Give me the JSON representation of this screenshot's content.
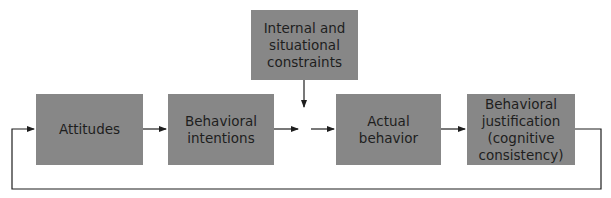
{
  "diagram": {
    "type": "flowchart",
    "colors": {
      "box_fill": "#878787",
      "text": "#1e1e1e",
      "line": "#1e1e1e",
      "background": "#ffffff"
    },
    "nodes": [
      {
        "id": "attitudes",
        "label": "Attitudes"
      },
      {
        "id": "intentions",
        "label": "Behavioral\nintentions"
      },
      {
        "id": "constraints",
        "label": "Internal and\nsituational\nconstraints"
      },
      {
        "id": "actual",
        "label": "Actual behavior"
      },
      {
        "id": "justification",
        "label": "Behavioral\njustification\n(cognitive\nconsistency)"
      }
    ],
    "edges": [
      {
        "from": "attitudes",
        "to": "intentions"
      },
      {
        "from": "intentions",
        "to": "actual",
        "via": "junction"
      },
      {
        "from": "constraints",
        "to": "junction"
      },
      {
        "from": "actual",
        "to": "justification"
      },
      {
        "from": "justification",
        "to": "attitudes",
        "type": "feedback-loop"
      }
    ]
  }
}
